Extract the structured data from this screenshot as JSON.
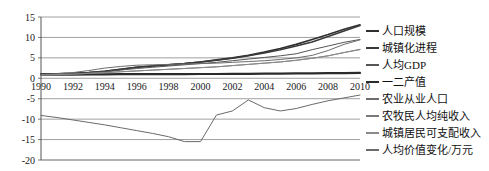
{
  "chart_data": {
    "type": "line",
    "title": "",
    "subtitle": "",
    "xlabel": "",
    "ylabel": "",
    "grid": true,
    "legend_position": "right",
    "x": [
      1990,
      1991,
      1992,
      1993,
      1994,
      1995,
      1996,
      1997,
      1998,
      1999,
      2000,
      2001,
      2002,
      2003,
      2004,
      2005,
      2006,
      2007,
      2008,
      2009,
      2010
    ],
    "xticks": [
      "1990",
      "1992",
      "1994",
      "1996",
      "1998",
      "2000",
      "2002",
      "2004",
      "2006",
      "2008",
      "2010"
    ],
    "yticks": [
      "15",
      "10",
      "5",
      "0",
      "-5",
      "-10",
      "-15",
      "-20"
    ],
    "xlim": [
      1990,
      2010
    ],
    "ylim": [
      -20,
      15
    ],
    "series": [
      {
        "name": "人口规模",
        "color": "#2f2f2f",
        "values": [
          1.0,
          1.1,
          1.2,
          1.4,
          1.7,
          2.2,
          2.7,
          3.0,
          3.3,
          3.6,
          4.0,
          4.5,
          5.0,
          5.6,
          6.4,
          7.3,
          8.3,
          9.5,
          10.7,
          12.0,
          13.1
        ]
      },
      {
        "name": "城镇化进程",
        "color": "#3a3a3a",
        "values": [
          1.0,
          1.1,
          1.2,
          1.4,
          1.7,
          2.2,
          2.7,
          3.0,
          3.3,
          3.6,
          4.0,
          4.4,
          4.9,
          5.5,
          6.2,
          7.0,
          7.9,
          8.9,
          10.2,
          11.6,
          12.9
        ]
      },
      {
        "name": "人均GDP",
        "color": "#565656",
        "values": [
          0.9,
          1.0,
          1.1,
          1.3,
          1.6,
          2.0,
          2.4,
          2.7,
          3.0,
          3.3,
          3.6,
          3.9,
          4.3,
          4.7,
          5.1,
          5.5,
          6.0,
          7.0,
          7.9,
          8.8,
          9.5
        ]
      },
      {
        "name": "一二产值",
        "color": "#2b2b2b",
        "values": [
          0.9,
          0.9,
          0.9,
          0.95,
          0.95,
          1.0,
          1.0,
          1.0,
          1.0,
          1.0,
          1.05,
          1.05,
          1.1,
          1.1,
          1.15,
          1.15,
          1.2,
          1.2,
          1.25,
          1.25,
          1.3
        ]
      },
      {
        "name": "农业从业人口",
        "color": "#6d6d6d",
        "values": [
          0.9,
          1.1,
          1.4,
          1.9,
          2.5,
          2.9,
          3.2,
          3.3,
          3.4,
          3.5,
          3.6,
          3.7,
          3.9,
          4.1,
          4.3,
          4.6,
          5.0,
          5.6,
          6.8,
          8.3,
          9.4
        ]
      },
      {
        "name": "农牧民人均纯收入",
        "color": "#7a7a7a",
        "values": [
          0.8,
          0.9,
          1.0,
          1.2,
          1.4,
          1.6,
          1.8,
          2.0,
          2.2,
          2.4,
          2.6,
          2.8,
          3.1,
          3.4,
          3.7,
          4.0,
          4.4,
          4.9,
          5.5,
          6.3,
          7.1
        ]
      },
      {
        "name": "城镇居民可支配收入",
        "color": "#8a8a8a",
        "values": [
          0.8,
          0.9,
          1.0,
          1.2,
          1.4,
          1.6,
          1.8,
          2.0,
          2.2,
          2.4,
          2.6,
          2.8,
          3.1,
          3.4,
          3.7,
          4.0,
          4.4,
          4.9,
          5.5,
          6.3,
          7.0
        ]
      },
      {
        "name": "人均价值变化/万元",
        "color": "#6a6a6a",
        "values": [
          -9.1,
          -9.6,
          -10.2,
          -10.8,
          -11.4,
          -12.1,
          -12.8,
          -13.5,
          -14.3,
          -15.5,
          -15.5,
          -9.0,
          -8.0,
          -5.3,
          -7.2,
          -8.0,
          -7.4,
          -6.4,
          -5.5,
          -4.8,
          -4.1
        ]
      }
    ]
  },
  "legend": {
    "items": [
      {
        "label": "人口规模"
      },
      {
        "label": "城镇化进程"
      },
      {
        "label": "人均GDP"
      },
      {
        "label": "一二产值"
      },
      {
        "label": "农业从业人口"
      },
      {
        "label": "农牧民人均纯收入"
      },
      {
        "label": "城镇居民可支配收入"
      },
      {
        "label": "人均价值变化/万元"
      }
    ]
  },
  "colors": {
    "axis": "#555555",
    "grid": "#888888",
    "text": "#101010",
    "background": "#ffffff"
  }
}
